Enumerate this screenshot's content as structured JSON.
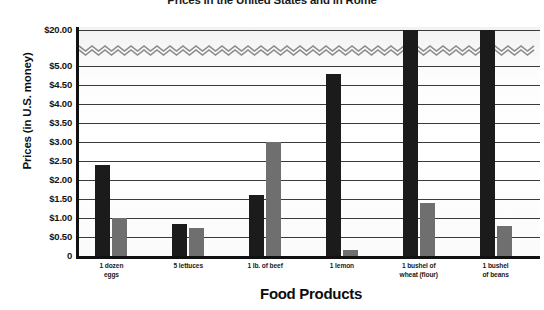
{
  "chart_data": {
    "type": "bar",
    "title": "Prices in the United States and in Rome",
    "xlabel": "Food Products",
    "ylabel": "Prices (in U.S. money)",
    "categories": [
      "1 dozen eggs",
      "5 lettuces",
      "1 lb. of beef",
      "1 lemon",
      "1 bushel of wheat (flour)",
      "1 bushel of beans"
    ],
    "category_lines": [
      [
        "1 dozen",
        "eggs"
      ],
      [
        "5 lettuces",
        ""
      ],
      [
        "1 lb. of beef",
        ""
      ],
      [
        "1 lemon",
        ""
      ],
      [
        "1 bushel of",
        "wheat (flour)"
      ],
      [
        "1 bushel",
        "of beans"
      ]
    ],
    "series": [
      {
        "name": "Rome",
        "color": "#1b1b1b",
        "values": [
          2.4,
          0.85,
          1.6,
          4.8,
          20.0,
          20.0
        ]
      },
      {
        "name": "United States",
        "color": "#6f6f6f",
        "values": [
          1.0,
          0.75,
          3.0,
          0.15,
          1.4,
          0.8
        ]
      }
    ],
    "ytick_labels": [
      "$20.00",
      "$5.00",
      "$4.50",
      "$4.00",
      "$3.50",
      "$3.00",
      "$2.50",
      "$2.00",
      "$1.50",
      "$1.00",
      "$0.50",
      "0"
    ],
    "ytick_values": [
      20.0,
      5.0,
      4.5,
      4.0,
      3.5,
      3.0,
      2.5,
      2.0,
      1.5,
      1.0,
      0.5,
      0
    ],
    "ylim": [
      0,
      20
    ],
    "axis_break": {
      "present": true,
      "between": [
        5.0,
        20.0
      ],
      "style": "zigzag"
    },
    "grid": true,
    "legend": "none"
  }
}
